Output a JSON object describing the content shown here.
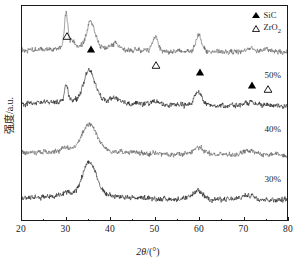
{
  "chart_data": {
    "type": "line",
    "title": "",
    "xlabel": "2θ/(°)",
    "ylabel": "强度/a.u.",
    "xlim": [
      20,
      80
    ],
    "ylim": [
      0,
      1
    ],
    "grid": false,
    "xticks": [
      20,
      30,
      40,
      50,
      60,
      70,
      80
    ],
    "xtick_labels": [
      "20",
      "30",
      "40",
      "50",
      "60",
      "70",
      "80"
    ],
    "xminorticks": [
      25,
      35,
      45,
      55,
      65,
      75
    ],
    "ytick_labels": [],
    "legend_position": "top-right",
    "legend": [
      {
        "marker": "filled-triangle",
        "label": "SiC"
      },
      {
        "marker": "open-triangle",
        "label": "ZrO2",
        "label_html": "ZrO<sub>2</sub>"
      }
    ],
    "peak_markers": [
      {
        "two_theta": 30.0,
        "phase": "ZrO2",
        "marker": "open-triangle"
      },
      {
        "two_theta": 35.6,
        "phase": "SiC",
        "marker": "filled-triangle"
      },
      {
        "two_theta": 50.2,
        "phase": "ZrO2",
        "marker": "open-triangle"
      },
      {
        "two_theta": 60.0,
        "phase": "SiC",
        "marker": "filled-triangle"
      },
      {
        "two_theta": 71.7,
        "phase": "SiC",
        "marker": "filled-triangle"
      },
      {
        "two_theta": 75.2,
        "phase": "ZrO2",
        "marker": "open-triangle"
      }
    ],
    "series": [
      {
        "name": "50%",
        "label": "50%",
        "color": "#555555",
        "baseline_frac": 0.215,
        "peaks": [
          {
            "x": 30.0,
            "h": 0.7,
            "w": 0.55
          },
          {
            "x": 31.4,
            "h": 0.13,
            "w": 0.7
          },
          {
            "x": 35.6,
            "h": 0.52,
            "w": 1.3
          },
          {
            "x": 41.3,
            "h": 0.1,
            "w": 1.1
          },
          {
            "x": 50.2,
            "h": 0.3,
            "w": 0.9
          },
          {
            "x": 60.0,
            "h": 0.33,
            "w": 1.0
          },
          {
            "x": 71.7,
            "h": 0.07,
            "w": 1.4
          },
          {
            "x": 75.2,
            "h": 0.05,
            "w": 1.4
          }
        ]
      },
      {
        "name": "40%",
        "label": "40%",
        "color": "#111111",
        "baseline_frac": 0.465,
        "peaks": [
          {
            "x": 30.0,
            "h": 0.33,
            "w": 0.55
          },
          {
            "x": 35.3,
            "h": 0.6,
            "w": 1.8
          },
          {
            "x": 41.0,
            "h": 0.09,
            "w": 1.4
          },
          {
            "x": 50.0,
            "h": 0.07,
            "w": 1.2
          },
          {
            "x": 59.9,
            "h": 0.27,
            "w": 1.2
          },
          {
            "x": 71.5,
            "h": 0.05,
            "w": 1.6
          }
        ]
      },
      {
        "name": "30%",
        "label": "30%",
        "color": "#555555",
        "baseline_frac": 0.695,
        "peaks": [
          {
            "x": 30.0,
            "h": 0.05,
            "w": 0.9
          },
          {
            "x": 35.3,
            "h": 0.52,
            "w": 2.3
          },
          {
            "x": 59.8,
            "h": 0.14,
            "w": 1.8
          },
          {
            "x": 71.4,
            "h": 0.07,
            "w": 2.0
          }
        ]
      },
      {
        "name": "20%",
        "label": "20%",
        "color": "#111111",
        "baseline_frac": 0.905,
        "peaks": [
          {
            "x": 30.2,
            "h": 0.06,
            "w": 1.2
          },
          {
            "x": 35.3,
            "h": 0.66,
            "w": 2.2
          },
          {
            "x": 59.8,
            "h": 0.16,
            "w": 1.7
          },
          {
            "x": 71.4,
            "h": 0.09,
            "w": 2.0
          }
        ]
      }
    ]
  }
}
